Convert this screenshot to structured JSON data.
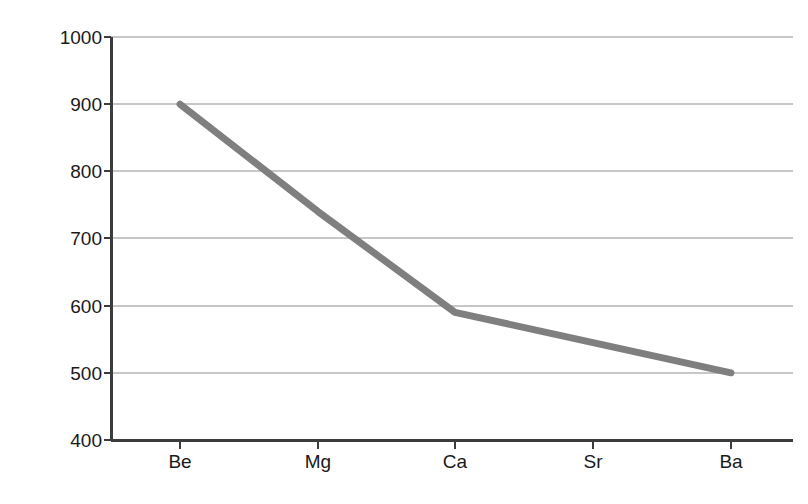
{
  "chart_data": {
    "type": "line",
    "title": "",
    "xlabel": "",
    "ylabel": "IE1 / kJ mol-1",
    "ylabel_parts": {
      "italic": "IE",
      "subscript": "1",
      "unit": " / kJ mol",
      "superscript": "−1"
    },
    "categories": [
      "Be",
      "Mg",
      "Ca",
      "Sr",
      "Ba"
    ],
    "values": [
      900,
      740,
      590,
      545,
      500
    ],
    "series": [
      {
        "name": "First ionisation energy",
        "values": [
          900,
          740,
          590,
          545,
          500
        ]
      }
    ],
    "ylim": [
      400,
      1000
    ],
    "yticks": [
      400,
      500,
      600,
      700,
      800,
      900,
      1000
    ],
    "ytick_labels": [
      "400",
      "500",
      "600",
      "700",
      "800",
      "900",
      "1000"
    ],
    "grid": true,
    "grid_axis": "y",
    "legend": "none",
    "line_color": "#7f7f7f",
    "line_width": 7,
    "grid_color": "#b4b4b4",
    "axis_color": "#3c3c3c",
    "text_color": "#1a1a1a",
    "background": "#ffffff",
    "markers": false
  },
  "axes": {
    "y_title_markup": "IE1 / kJ mol−1",
    "x_tick_labels": [
      "Be",
      "Mg",
      "Ca",
      "Sr",
      "Ba"
    ],
    "y_tick_labels": [
      "1000",
      "900",
      "800",
      "700",
      "600",
      "500",
      "400"
    ]
  }
}
